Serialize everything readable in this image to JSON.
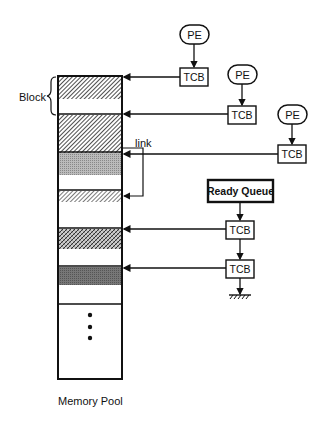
{
  "labels": {
    "block": "Block",
    "link": "link",
    "memory_pool": "Memory Pool",
    "ready_queue": "Ready Queue",
    "pe": "PE",
    "tcb": "TCB"
  },
  "processing_elements": [
    {
      "label": "PE",
      "tcb_label": "TCB"
    },
    {
      "label": "PE",
      "tcb_label": "TCB"
    },
    {
      "label": "PE",
      "tcb_label": "TCB"
    }
  ],
  "ready_queue_tcbs": [
    {
      "label": "TCB"
    },
    {
      "label": "TCB"
    }
  ],
  "memory_blocks": [
    {
      "pattern": "hatch-dense"
    },
    {
      "pattern": "hatch-dense"
    },
    {
      "pattern": "dotted-gray"
    },
    {
      "pattern": "hatch-light"
    },
    {
      "pattern": "crosshatch"
    },
    {
      "pattern": "dark-gray"
    }
  ],
  "colors": {
    "line": "#111111",
    "background": "#ffffff"
  }
}
